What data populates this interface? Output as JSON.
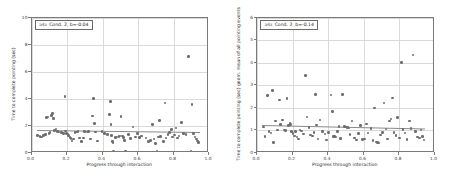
{
  "figure": {
    "background": "#ffffff",
    "point_color": "#6e6e6e",
    "line_color": "#8a8a8a",
    "grid_color": "#d9d9d9",
    "frame_color": "#7a7a7a"
  },
  "panels": [
    {
      "id": "left",
      "legend": {
        "marker": "a4a",
        "text": "Cond. 2, b=-0.04"
      },
      "xlabel": "Progress through interaction",
      "ylabel": "Time to complete pointing (sec)",
      "xticks": [
        "0.0",
        "0.2",
        "0.4",
        "0.6",
        "0.8",
        "1.0"
      ],
      "yticks": [
        "0",
        "2",
        "4",
        "6",
        "8",
        "10"
      ]
    },
    {
      "id": "right",
      "legend": {
        "marker": "a4a",
        "text": "Cond. 2, b=-0.14"
      },
      "xlabel": "Progress through interaction",
      "ylabel": "Time to complete pointing (sec) geom. mean of all pointing events",
      "xticks": [
        "0.0",
        "0.2",
        "0.4",
        "0.6",
        "0.8",
        "1.0"
      ],
      "yticks": [
        "0",
        "1",
        "2",
        "3",
        "4",
        "5",
        "6"
      ]
    }
  ],
  "chart_data": [
    {
      "type": "scatter",
      "id": "left",
      "title": "",
      "xlabel": "Progress through interaction",
      "ylabel": "Time to complete pointing (sec)",
      "xlim": [
        0.0,
        1.0
      ],
      "ylim": [
        0,
        10
      ],
      "xticks": [
        0.0,
        0.2,
        0.4,
        0.6,
        0.8,
        1.0
      ],
      "yticks": [
        0,
        2,
        4,
        6,
        8,
        10
      ],
      "grid": true,
      "legend": "a4a  Cond. 2, b=-0.04",
      "annotation": "b=-0.04",
      "fit_line": {
        "x0": 0.03,
        "y0": 1.72,
        "x1": 0.95,
        "y1": 1.58
      },
      "points": [
        [
          0.035,
          1.28
        ],
        [
          0.048,
          1.22
        ],
        [
          0.058,
          1.18
        ],
        [
          0.068,
          1.3
        ],
        [
          0.078,
          1.36
        ],
        [
          0.085,
          2.6
        ],
        [
          0.092,
          2.66
        ],
        [
          0.098,
          1.44
        ],
        [
          0.105,
          1.52
        ],
        [
          0.112,
          2.78
        ],
        [
          0.118,
          2.92
        ],
        [
          0.124,
          2.54
        ],
        [
          0.13,
          1.66
        ],
        [
          0.138,
          1.78
        ],
        [
          0.146,
          1.58
        ],
        [
          0.155,
          1.56
        ],
        [
          0.168,
          1.5
        ],
        [
          0.18,
          1.46
        ],
        [
          0.188,
          4.18
        ],
        [
          0.192,
          1.62
        ],
        [
          0.198,
          1.44
        ],
        [
          0.205,
          1.4
        ],
        [
          0.21,
          1.3
        ],
        [
          0.216,
          1.14
        ],
        [
          0.222,
          1.06
        ],
        [
          0.228,
          0.88
        ],
        [
          0.236,
          1.02
        ],
        [
          0.244,
          1.52
        ],
        [
          0.252,
          1.56
        ],
        [
          0.262,
          1.58
        ],
        [
          0.272,
          1.12
        ],
        [
          0.282,
          0.86
        ],
        [
          0.292,
          1.1
        ],
        [
          0.3,
          1.58
        ],
        [
          0.312,
          1.56
        ],
        [
          0.322,
          1.58
        ],
        [
          0.332,
          1.04
        ],
        [
          0.342,
          2.72
        ],
        [
          0.348,
          4.02
        ],
        [
          0.355,
          2.18
        ],
        [
          0.362,
          1.56
        ],
        [
          0.372,
          0.88
        ],
        [
          0.398,
          1.58
        ],
        [
          0.412,
          1.44
        ],
        [
          0.428,
          1.38
        ],
        [
          0.44,
          2.82
        ],
        [
          0.444,
          3.8
        ],
        [
          0.448,
          2.12
        ],
        [
          0.452,
          1.3
        ],
        [
          0.456,
          0.86
        ],
        [
          0.46,
          0.78
        ],
        [
          0.462,
          0.12
        ],
        [
          0.472,
          1.16
        ],
        [
          0.482,
          1.18
        ],
        [
          0.492,
          1.22
        ],
        [
          0.498,
          1.24
        ],
        [
          0.505,
          2.68
        ],
        [
          0.512,
          1.26
        ],
        [
          0.518,
          1.14
        ],
        [
          0.524,
          0.92
        ],
        [
          0.53,
          0.14
        ],
        [
          0.548,
          1.36
        ],
        [
          0.558,
          1.08
        ],
        [
          0.572,
          1.92
        ],
        [
          0.585,
          1.18
        ],
        [
          0.598,
          1.46
        ],
        [
          0.608,
          1.16
        ],
        [
          0.62,
          1.24
        ],
        [
          0.645,
          1.1
        ],
        [
          0.66,
          0.86
        ],
        [
          0.672,
          0.94
        ],
        [
          0.682,
          2.12
        ],
        [
          0.69,
          1.04
        ],
        [
          0.698,
          0.7
        ],
        [
          0.706,
          0.12
        ],
        [
          0.716,
          1.18
        ],
        [
          0.722,
          2.42
        ],
        [
          0.728,
          1.2
        ],
        [
          0.742,
          0.84
        ],
        [
          0.752,
          3.7
        ],
        [
          0.758,
          1.12
        ],
        [
          0.768,
          1.36
        ],
        [
          0.778,
          1.5
        ],
        [
          0.788,
          1.72
        ],
        [
          0.795,
          1.18
        ],
        [
          0.805,
          1.32
        ],
        [
          0.815,
          1.86
        ],
        [
          0.822,
          1.1
        ],
        [
          0.832,
          1.24
        ],
        [
          0.845,
          2.24
        ],
        [
          0.858,
          1.42
        ],
        [
          0.87,
          1.36
        ],
        [
          0.885,
          7.1
        ],
        [
          0.898,
          0.12
        ],
        [
          0.905,
          3.6
        ],
        [
          0.912,
          1.44
        ],
        [
          0.92,
          1.18
        ],
        [
          0.928,
          1.02
        ],
        [
          0.935,
          0.9
        ],
        [
          0.942,
          0.76
        ]
      ]
    },
    {
      "type": "scatter",
      "id": "right",
      "title": "",
      "xlabel": "Progress through interaction",
      "ylabel": "Time to complete pointing (sec) geom. mean of all pointing events",
      "xlim": [
        0.0,
        1.0
      ],
      "ylim": [
        0,
        6
      ],
      "xticks": [
        0.0,
        0.2,
        0.4,
        0.6,
        0.8,
        1.0
      ],
      "yticks": [
        0,
        1,
        2,
        3,
        4,
        5,
        6
      ],
      "grid": true,
      "legend": "a4a  Cond. 2, b=-0.14",
      "annotation": "b=-0.14",
      "fit_line": {
        "x0": 0.03,
        "y0": 1.26,
        "x1": 0.95,
        "y1": 1.1
      },
      "points": [
        [
          0.035,
          1.16
        ],
        [
          0.045,
          0.74
        ],
        [
          0.058,
          2.54
        ],
        [
          0.068,
          0.96
        ],
        [
          0.078,
          0.88
        ],
        [
          0.086,
          2.78
        ],
        [
          0.092,
          0.46
        ],
        [
          0.105,
          1.42
        ],
        [
          0.116,
          1.02
        ],
        [
          0.126,
          2.34
        ],
        [
          0.134,
          1.26
        ],
        [
          0.142,
          1.46
        ],
        [
          0.152,
          1.02
        ],
        [
          0.162,
          1.0
        ],
        [
          0.17,
          2.42
        ],
        [
          0.178,
          1.22
        ],
        [
          0.186,
          1.3
        ],
        [
          0.19,
          1.26
        ],
        [
          0.196,
          0.96
        ],
        [
          0.202,
          0.86
        ],
        [
          0.21,
          0.76
        ],
        [
          0.218,
          0.94
        ],
        [
          0.226,
          0.7
        ],
        [
          0.234,
          0.62
        ],
        [
          0.242,
          1.02
        ],
        [
          0.252,
          0.98
        ],
        [
          0.262,
          0.84
        ],
        [
          0.272,
          3.42
        ],
        [
          0.282,
          1.6
        ],
        [
          0.292,
          1.14
        ],
        [
          0.302,
          0.8
        ],
        [
          0.312,
          0.76
        ],
        [
          0.322,
          0.92
        ],
        [
          0.33,
          2.58
        ],
        [
          0.336,
          1.24
        ],
        [
          0.344,
          0.62
        ],
        [
          0.356,
          1.46
        ],
        [
          0.368,
          0.94
        ],
        [
          0.382,
          0.84
        ],
        [
          0.392,
          0.58
        ],
        [
          0.404,
          0.9
        ],
        [
          0.416,
          2.56
        ],
        [
          0.424,
          1.84
        ],
        [
          0.432,
          0.74
        ],
        [
          0.438,
          0.72
        ],
        [
          0.444,
          0.7
        ],
        [
          0.452,
          0.94
        ],
        [
          0.462,
          1.18
        ],
        [
          0.472,
          0.64
        ],
        [
          0.482,
          2.58
        ],
        [
          0.492,
          1.18
        ],
        [
          0.5,
          1.16
        ],
        [
          0.506,
          1.14
        ],
        [
          0.512,
          1.12
        ],
        [
          0.518,
          1.1
        ],
        [
          0.524,
          0.82
        ],
        [
          0.536,
          1.42
        ],
        [
          0.548,
          0.66
        ],
        [
          0.56,
          0.58
        ],
        [
          0.572,
          0.86
        ],
        [
          0.584,
          1.22
        ],
        [
          0.596,
          0.6
        ],
        [
          0.606,
          0.62
        ],
        [
          0.616,
          1.28
        ],
        [
          0.626,
          0.88
        ],
        [
          0.642,
          1.08
        ],
        [
          0.654,
          0.56
        ],
        [
          0.662,
          2.0
        ],
        [
          0.67,
          0.48
        ],
        [
          0.678,
          0.46
        ],
        [
          0.686,
          0.44
        ],
        [
          0.696,
          0.8
        ],
        [
          0.706,
          0.9
        ],
        [
          0.716,
          2.22
        ],
        [
          0.726,
          1.06
        ],
        [
          0.736,
          0.62
        ],
        [
          0.748,
          1.42
        ],
        [
          0.756,
          1.5
        ],
        [
          0.762,
          2.44
        ],
        [
          0.772,
          0.9
        ],
        [
          0.782,
          0.78
        ],
        [
          0.792,
          1.56
        ],
        [
          0.804,
          0.66
        ],
        [
          0.814,
          4.0
        ],
        [
          0.822,
          1.04
        ],
        [
          0.834,
          0.88
        ],
        [
          0.846,
          0.6
        ],
        [
          0.858,
          1.42
        ],
        [
          0.868,
          1.08
        ],
        [
          0.88,
          4.34
        ],
        [
          0.892,
          0.96
        ],
        [
          0.904,
          0.7
        ],
        [
          0.916,
          0.66
        ],
        [
          0.924,
          1.02
        ],
        [
          0.932,
          0.72
        ],
        [
          0.94,
          0.58
        ]
      ]
    }
  ]
}
